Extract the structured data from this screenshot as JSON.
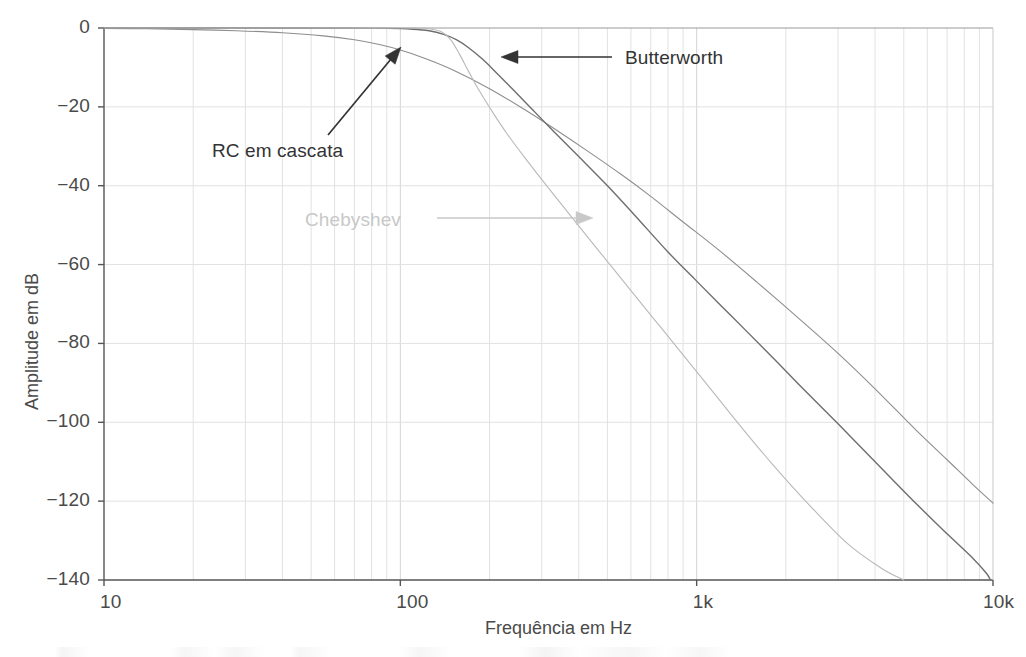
{
  "figure": {
    "background_color": "#ffffff",
    "axis_color": "#555555",
    "grid_color": "#e2e2e2",
    "plot_area": {
      "left": 104,
      "right": 993,
      "top": 28,
      "bottom": 580
    }
  },
  "axes": {
    "x": {
      "label": "Frequência em Hz",
      "scale": "log",
      "min": 10,
      "max": 10000,
      "tick_labels": [
        "10",
        "100",
        "1k",
        "10k"
      ],
      "tick_values": [
        10,
        100,
        1000,
        10000
      ],
      "minor_ticks_per_decade": [
        2,
        3,
        4,
        5,
        6,
        7,
        8,
        9
      ]
    },
    "y": {
      "label": "Amplitude em dB",
      "scale": "linear",
      "min": -140,
      "max": 0,
      "tick_labels": [
        "0",
        "−20",
        "−40",
        "−60",
        "−80",
        "−100",
        "−120",
        "−140"
      ],
      "tick_values": [
        0,
        -20,
        -40,
        -60,
        -80,
        -100,
        -120,
        -140
      ]
    }
  },
  "annotations": [
    {
      "id": "butterworth",
      "text": "Butterworth",
      "color": "#333333",
      "text_x": 625,
      "text_y": 47,
      "arrow_from_x": 612,
      "arrow_from_y": 57,
      "arrow_to_x": 501,
      "arrow_to_y": 57
    },
    {
      "id": "rc-cascata",
      "text": "RC em cascata",
      "color": "#333333",
      "text_x": 212,
      "text_y": 140,
      "arrow_from_x": 328,
      "arrow_from_y": 135,
      "arrow_to_x": 401,
      "arrow_to_y": 47
    },
    {
      "id": "chebyshev",
      "text": "Chebyshev",
      "color": "#c8c8c8",
      "text_x": 305,
      "text_y": 209,
      "arrow_from_x": 437,
      "arrow_from_y": 218,
      "arrow_to_x": 593,
      "arrow_to_y": 218
    }
  ],
  "chart_data": {
    "type": "line",
    "title": "",
    "xlabel": "Frequência em Hz",
    "ylabel": "Amplitude em dB",
    "xscale": "log",
    "xlim": [
      10,
      10000
    ],
    "ylim": [
      -140,
      0
    ],
    "grid": true,
    "legend": "annotated-inline",
    "x_tick_labels": [
      "10",
      "100",
      "1k",
      "10k"
    ],
    "y_tick_labels": [
      "0",
      "-20",
      "-40",
      "-60",
      "-80",
      "-100",
      "-120",
      "-140"
    ],
    "series": [
      {
        "name": "RC em cascata",
        "color": "#8e8e8e",
        "width": 1.1,
        "points": [
          [
            10,
            -0.1
          ],
          [
            14,
            -0.2
          ],
          [
            20,
            -0.4
          ],
          [
            28,
            -0.7
          ],
          [
            40,
            -1.2
          ],
          [
            55,
            -2.0
          ],
          [
            70,
            -3.0
          ],
          [
            85,
            -4.2
          ],
          [
            100,
            -5.6
          ],
          [
            120,
            -7.6
          ],
          [
            150,
            -10.6
          ],
          [
            200,
            -15.4
          ],
          [
            260,
            -20.5
          ],
          [
            330,
            -25.5
          ],
          [
            430,
            -31.3
          ],
          [
            560,
            -37.3
          ],
          [
            700,
            -42.7
          ],
          [
            900,
            -49.2
          ],
          [
            1200,
            -56.6
          ],
          [
            1600,
            -64.5
          ],
          [
            2200,
            -73.5
          ],
          [
            3000,
            -82.5
          ],
          [
            4000,
            -91.5
          ],
          [
            5500,
            -102.0
          ],
          [
            7000,
            -109.5
          ],
          [
            8500,
            -115.6
          ],
          [
            10000,
            -120.5
          ]
        ]
      },
      {
        "name": "Butterworth",
        "color": "#6e6e6e",
        "width": 1.4,
        "points": [
          [
            10,
            0
          ],
          [
            30,
            0
          ],
          [
            60,
            -0.05
          ],
          [
            90,
            -0.1
          ],
          [
            110,
            -0.3
          ],
          [
            125,
            -0.7
          ],
          [
            140,
            -1.6
          ],
          [
            155,
            -3.0
          ],
          [
            170,
            -5.0
          ],
          [
            190,
            -8.0
          ],
          [
            210,
            -11.2
          ],
          [
            240,
            -15.6
          ],
          [
            280,
            -20.8
          ],
          [
            330,
            -26.3
          ],
          [
            400,
            -32.6
          ],
          [
            500,
            -40.0
          ],
          [
            620,
            -47.6
          ],
          [
            800,
            -56.8
          ],
          [
            1000,
            -64.2
          ],
          [
            1300,
            -72.8
          ],
          [
            1700,
            -81.6
          ],
          [
            2200,
            -90.2
          ],
          [
            3000,
            -100.4
          ],
          [
            4000,
            -110.0
          ],
          [
            5500,
            -120.6
          ],
          [
            7000,
            -128.3
          ],
          [
            8500,
            -134.3
          ],
          [
            9500,
            -138.3
          ],
          [
            9800,
            -140
          ]
        ]
      },
      {
        "name": "Chebyshev",
        "color": "#b9b9b9",
        "width": 1.1,
        "points": [
          [
            10,
            0
          ],
          [
            40,
            0
          ],
          [
            80,
            -0.05
          ],
          [
            110,
            0
          ],
          [
            125,
            -0.2
          ],
          [
            138,
            -1.0
          ],
          [
            148,
            -3.0
          ],
          [
            158,
            -6.5
          ],
          [
            170,
            -11.0
          ],
          [
            185,
            -16.0
          ],
          [
            205,
            -21.4
          ],
          [
            230,
            -27.0
          ],
          [
            265,
            -33.2
          ],
          [
            310,
            -39.8
          ],
          [
            370,
            -47.0
          ],
          [
            450,
            -55.0
          ],
          [
            560,
            -63.8
          ],
          [
            700,
            -72.8
          ],
          [
            880,
            -82.0
          ],
          [
            1100,
            -91.0
          ],
          [
            1400,
            -100.8
          ],
          [
            1800,
            -110.6
          ],
          [
            2400,
            -121.0
          ],
          [
            3200,
            -130.5
          ],
          [
            4200,
            -137.0
          ],
          [
            5000,
            -140
          ]
        ]
      }
    ]
  }
}
